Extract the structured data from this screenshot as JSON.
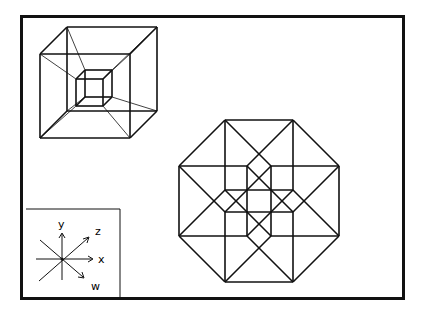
{
  "axes_legend": {
    "labels": {
      "y": "y",
      "z": "z",
      "x": "x",
      "w": "w"
    }
  },
  "colors": {
    "stroke": "#111111",
    "background": "#ffffff"
  }
}
